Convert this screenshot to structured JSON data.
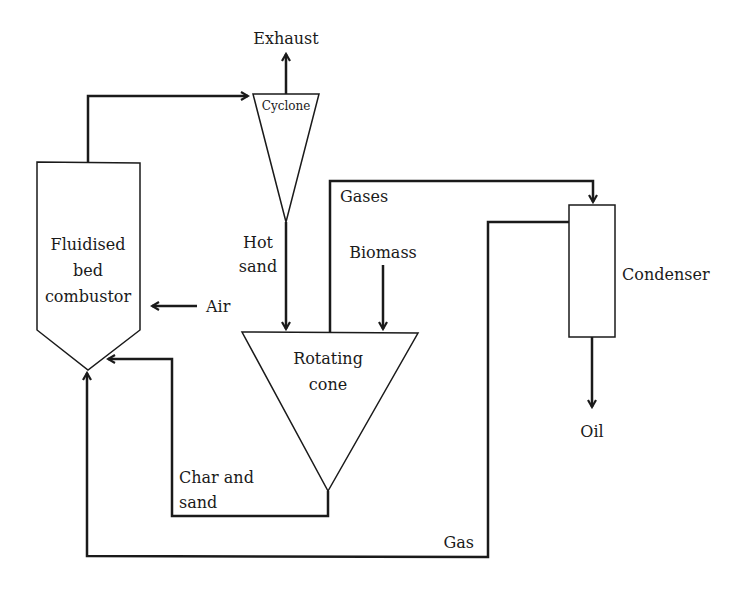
{
  "diagram": {
    "type": "process-flow",
    "units": {
      "combustor": {
        "label_lines": [
          "Fluidised",
          "bed",
          "combustor"
        ]
      },
      "cyclone": {
        "label": "Cyclone"
      },
      "rotating_cone": {
        "label_lines": [
          "Rotating",
          "cone"
        ]
      },
      "condenser": {
        "label": "Condenser"
      }
    },
    "streams": {
      "exhaust": "Exhaust",
      "hot_sand": [
        "Hot",
        "sand"
      ],
      "biomass": "Biomass",
      "air": "Air",
      "gases": "Gases",
      "char_and_sand": [
        "Char and",
        "sand"
      ],
      "gas": "Gas",
      "oil": "Oil"
    },
    "connections": [
      {
        "from": "Fluidised bed combustor",
        "to": "Cyclone"
      },
      {
        "from": "Cyclone",
        "to": "Exhaust"
      },
      {
        "from": "Cyclone",
        "to": "Rotating cone",
        "stream": "Hot sand"
      },
      {
        "from": "Biomass",
        "to": "Rotating cone"
      },
      {
        "from": "Air",
        "to": "Fluidised bed combustor"
      },
      {
        "from": "Rotating cone",
        "to": "Condenser",
        "stream": "Gases"
      },
      {
        "from": "Condenser",
        "to": "Oil"
      },
      {
        "from": "Condenser",
        "to": "Fluidised bed combustor",
        "stream": "Gas"
      },
      {
        "from": "Rotating cone",
        "to": "Fluidised bed combustor",
        "stream": "Char and sand"
      }
    ]
  }
}
